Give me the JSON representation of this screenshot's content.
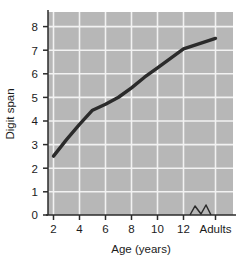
{
  "chart_data": {
    "type": "line",
    "title": "",
    "xlabel": "Age (years)",
    "ylabel": "Digit span",
    "xticklabels": [
      "2",
      "4",
      "6",
      "8",
      "10",
      "12",
      "Adults"
    ],
    "xtickvalues": [
      2,
      4,
      6,
      8,
      10,
      12,
      15
    ],
    "yticklabels": [
      "0",
      "1",
      "2",
      "3",
      "4",
      "5",
      "6",
      "7",
      "8"
    ],
    "ytickvalues": [
      0,
      1,
      2,
      3,
      4,
      5,
      6,
      7,
      8
    ],
    "xlim": [
      1.2,
      15.8
    ],
    "ylim": [
      0,
      8.45
    ],
    "grid": true,
    "legend": "none",
    "axis_break": {
      "present": true,
      "between": [
        "12",
        "Adults"
      ],
      "symbol": "zigzag"
    },
    "series": [
      {
        "name": "Digit span",
        "x": [
          2,
          3,
          4,
          5,
          6,
          7,
          8,
          9,
          10,
          11,
          12,
          13,
          15
        ],
        "y": [
          2.5,
          3.2,
          3.85,
          4.45,
          4.7,
          5.0,
          5.4,
          5.85,
          6.25,
          6.65,
          7.05,
          7.2,
          7.5
        ],
        "color": "#2b2b2b",
        "linewidth": 3.4
      }
    ],
    "colors": {
      "plot_background": "#b7b7b7",
      "gridline": "#f2f2f2",
      "axis": "#2b2b2b",
      "text": "#1b1b1b",
      "page_background": "#ffffff"
    }
  }
}
